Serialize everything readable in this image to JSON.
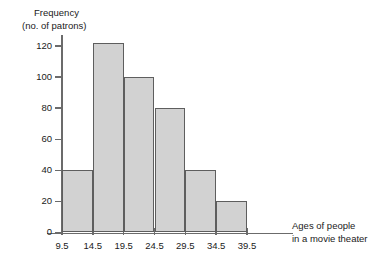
{
  "chart_data": {
    "type": "bar",
    "title": "",
    "subtitle": "",
    "ylabel_lines": [
      "Frequency",
      "(no. of patrons)"
    ],
    "xlabel_lines": [
      "Ages of people",
      "in a movie theater"
    ],
    "bin_edges": [
      9.5,
      14.5,
      19.5,
      24.5,
      29.5,
      34.5,
      39.5
    ],
    "xtick_labels": [
      "9.5",
      "14.5",
      "19.5",
      "24.5",
      "29.5",
      "34.5",
      "39.5"
    ],
    "categories": [
      "9.5-14.5",
      "14.5-19.5",
      "19.5-24.5",
      "24.5-29.5",
      "29.5-34.5",
      "34.5-39.5"
    ],
    "values": [
      40,
      122,
      100,
      80,
      40,
      20
    ],
    "ytick_labels": [
      "0",
      "20",
      "40",
      "60",
      "80",
      "100",
      "120"
    ],
    "ytick_values": [
      0,
      20,
      40,
      60,
      80,
      100,
      120
    ],
    "ylim": [
      0,
      130
    ],
    "xlim": [
      9.5,
      39.5
    ],
    "grid": false,
    "legend": false,
    "bar_fill_color": "#d2d2d2",
    "bar_edge_color": "#5e5e5e",
    "axis_color": "#6b6b6b",
    "text_color": "#1a1a1a"
  }
}
